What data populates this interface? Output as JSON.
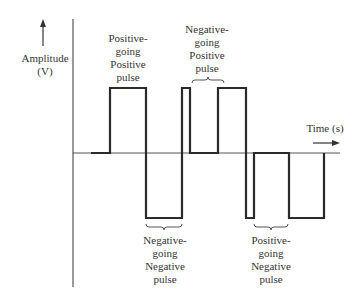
{
  "diagram": {
    "y_axis": {
      "label": "Amplitude",
      "unit": "(V)"
    },
    "x_axis": {
      "label": "Time (s)"
    },
    "annotations": [
      {
        "id": "pos-going-pos",
        "lines": [
          "Positive-",
          "going",
          "Positive",
          "pulse"
        ]
      },
      {
        "id": "neg-going-pos",
        "lines": [
          "Negative-",
          "going",
          "Positive",
          "pulse"
        ]
      },
      {
        "id": "neg-going-neg",
        "lines": [
          "Negative-",
          "going",
          "Negative",
          "pulse"
        ]
      },
      {
        "id": "pos-going-neg",
        "lines": [
          "Positive-",
          "going",
          "Negative",
          "pulse"
        ]
      }
    ],
    "colors": {
      "line": "#2a2a2a",
      "axis": "#555555",
      "background": "#ffffff"
    }
  }
}
